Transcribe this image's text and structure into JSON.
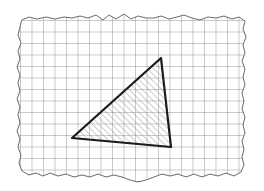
{
  "figure": {
    "kind": "geometry-diagram",
    "canvas": {
      "width": 264,
      "height": 191,
      "background": "#ffffff"
    },
    "paper": {
      "name": "graph-paper-sheet",
      "fill": "#ffffff",
      "edge_color": "#6a6a6a",
      "edge_width": 1,
      "style": "torn-scalloped",
      "bounds": {
        "left": 17,
        "top": 14,
        "right": 246,
        "bottom": 177
      },
      "outline_path": "M 22,20 L 29,17 L 37,19 L 46,17 L 55,19 L 64,17 L 72,18 L 80,16 L 88,18 L 96,15 L 103,20 L 109,15 L 116,19 L 124,14 L 131,19 L 138,16 L 146,18 L 154,18 L 161,16 L 169,19 L 177,17 L 184,15 L 192,18 L 200,20 L 208,17 L 216,18 L 224,16 L 232,19 L 239,17 L 245,21 L 243,29 L 246,37 L 243,45 L 245,53 L 242,61 L 245,69 L 243,77 L 245,85 L 242,93 L 244,101 L 242,109 L 245,117 L 243,125 L 245,133 L 242,141 L 244,149 L 242,157 L 244,165 L 241,172 L 234,176 L 226,173 L 218,176 L 210,174 L 202,177 L 194,174 L 186,177 L 178,174 L 170,176 L 162,174 L 154,177 L 146,180 L 138,182 L 130,180 L 122,177 L 114,175 L 106,177 L 98,174 L 90,177 L 82,175 L 74,177 L 66,174 L 58,176 L 50,173 L 43,176 L 36,173 L 29,175 L 22,171 L 19,163 L 21,155 L 18,147 L 20,139 L 17,131 L 20,123 L 18,115 L 20,107 L 17,99 L 20,91 L 18,83 L 20,75 L 17,67 L 20,59 L 18,51 L 21,43 L 18,35 L 20,27 Z"
    },
    "grid": {
      "name": "graph-paper-grid",
      "spacing_px": 11.5,
      "line_color": "#8d8d8d",
      "line_width": 0.9,
      "orientation": "square",
      "origin": {
        "x": 20,
        "y": 20
      }
    },
    "triangle": {
      "name": "hatched-triangle",
      "stroke": "#1a1a1a",
      "stroke_width": 2.2,
      "fill": "none",
      "vertices": [
        {
          "label": "A",
          "x": 161,
          "y": 58
        },
        {
          "label": "B",
          "x": 171,
          "y": 147
        },
        {
          "label": "C",
          "x": 72,
          "y": 138
        }
      ],
      "hatch": {
        "name": "diagonal-hatch-fill",
        "angle_deg": 45,
        "direction": "up-right",
        "spacing_px": 4.6,
        "line_color": "#909090",
        "line_width": 0.9
      }
    },
    "labels": []
  }
}
